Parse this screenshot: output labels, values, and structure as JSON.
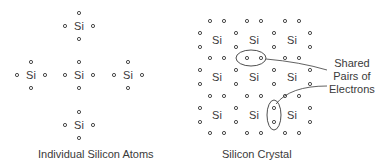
{
  "diagram": {
    "left_panel": {
      "caption": "Individual Silicon Atoms",
      "atom_label": "Si",
      "atoms": [
        {
          "x": 79,
          "y": 26
        },
        {
          "x": 31,
          "y": 75
        },
        {
          "x": 79,
          "y": 75
        },
        {
          "x": 128,
          "y": 75
        },
        {
          "x": 79,
          "y": 125
        }
      ]
    },
    "right_panel": {
      "caption": "Silicon Crystal",
      "atom_label": "Si",
      "columns": [
        217,
        254,
        292
      ],
      "rows": [
        40,
        77,
        115
      ],
      "callout": {
        "line1": "Shared",
        "line2": "Pairs of",
        "line3": "Electrons"
      }
    },
    "colors": {
      "ink": "#3a3a3a",
      "background": "#ffffff"
    }
  }
}
